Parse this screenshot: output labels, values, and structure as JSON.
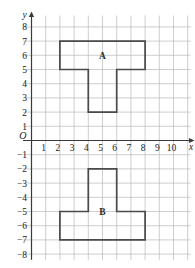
{
  "chart_data": {
    "type": "scatter",
    "title": "",
    "xlabel": "x",
    "ylabel": "y",
    "grid": true,
    "legend_position": "none",
    "xlim": [
      -0.6,
      11.2
    ],
    "ylim": [
      -8.4,
      8.8
    ],
    "x_ticks": [
      1,
      2,
      3,
      4,
      5,
      6,
      7,
      8,
      9,
      10
    ],
    "x_tick_labels": [
      "1",
      "2",
      "3",
      "4",
      "5",
      "6",
      "7",
      "8",
      "9",
      "10"
    ],
    "y_ticks": [
      8,
      7,
      6,
      5,
      4,
      3,
      2,
      1,
      -1,
      -2,
      -3,
      -4,
      -5,
      -6,
      -7,
      -8
    ],
    "y_tick_labels": [
      "8",
      "7",
      "6",
      "5",
      "4",
      "3",
      "2",
      "1",
      "−1",
      "−2",
      "−3",
      "−4",
      "−5",
      "−6",
      "−7",
      "−8"
    ],
    "origin_label": "O",
    "x_axis_label": "x",
    "y_axis_label": "y",
    "annotations": [
      {
        "text": "A",
        "x": 5,
        "y": 6
      },
      {
        "text": "B",
        "x": 5,
        "y": -5
      }
    ],
    "shapes": [
      {
        "name": "A",
        "label": "A",
        "description": "T-shaped polygon above the x-axis",
        "vertices": [
          [
            2,
            7
          ],
          [
            8,
            7
          ],
          [
            8,
            5
          ],
          [
            6,
            5
          ],
          [
            6,
            2
          ],
          [
            4,
            2
          ],
          [
            4,
            5
          ],
          [
            2,
            5
          ]
        ]
      },
      {
        "name": "B",
        "label": "B",
        "description": "Inverted T-shaped polygon below the x-axis",
        "vertices": [
          [
            4,
            -2
          ],
          [
            6,
            -2
          ],
          [
            6,
            -5
          ],
          [
            8,
            -5
          ],
          [
            8,
            -7
          ],
          [
            2,
            -7
          ],
          [
            2,
            -5
          ],
          [
            4,
            -5
          ]
        ]
      }
    ]
  }
}
